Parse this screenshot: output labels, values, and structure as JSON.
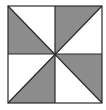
{
  "figure": {
    "square": {
      "x": 8,
      "y": 6,
      "width": 94,
      "height": 97
    },
    "center": {
      "x": 55,
      "y": 54
    },
    "colors": {
      "shaded": "#8c8c8c",
      "unshaded": "#ffffff",
      "stroke": "#2a2a2a",
      "background": "#ffffff"
    },
    "shaded_triangles": [
      {
        "quadrant": "top-left",
        "points": "8,6 55,54 8,54"
      },
      {
        "quadrant": "top-right",
        "points": "55,6 102,6 55,54"
      },
      {
        "quadrant": "bottom-left",
        "points": "55,54 8,103 55,103"
      },
      {
        "quadrant": "bottom-right",
        "points": "55,54 102,54 102,103"
      }
    ]
  }
}
